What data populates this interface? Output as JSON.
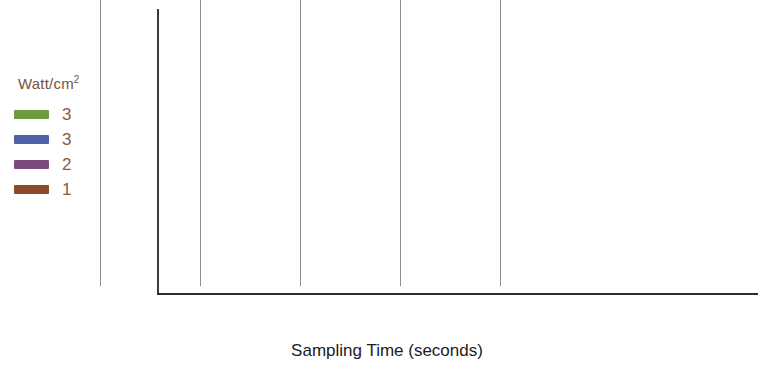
{
  "chart_data": {
    "type": "line",
    "title": "",
    "xlabel": "Sampling Time (seconds)",
    "ylabel": "",
    "legend_title": "Watt/cm",
    "legend_title_sup": "2",
    "legend_position": "left",
    "grid": "vertical",
    "x": [
      0,
      30,
      60,
      90,
      120,
      150,
      180
    ],
    "xlim": [
      0,
      180
    ],
    "ylim": [
      5,
      46
    ],
    "xticks": [
      "0",
      "30",
      "60",
      "90",
      "120",
      "150",
      "180"
    ],
    "yticks": [
      "10",
      "20",
      "30",
      "40"
    ],
    "ytick_values": [
      10,
      20,
      30,
      40
    ],
    "series": [
      {
        "name": "3",
        "color": "#6d9b3f",
        "values": [
          19.5,
          35.5,
          40.6,
          41.1,
          41.2,
          43.0,
          45.0
        ]
      },
      {
        "name": "3",
        "color": "#4f62a8",
        "values": [
          23.7,
          26.1,
          26.1,
          27.0,
          28.1,
          29.5,
          31.0
        ]
      },
      {
        "name": "2",
        "color": "#7c4a7e",
        "values": [
          19.2,
          24.2,
          24.5,
          25.1,
          25.5,
          25.4,
          25.3
        ]
      },
      {
        "name": "1",
        "color": "#8b4a2c",
        "values": [
          19.4,
          21.2,
          21.4,
          22.5,
          23.9,
          23.9,
          24.0
        ]
      }
    ]
  },
  "legend": {
    "title": "Watt/cm",
    "title_superscript": "2",
    "items": [
      {
        "label": "3",
        "color": "#6d9b3f"
      },
      {
        "label": "3",
        "color": "#4f62a8"
      },
      {
        "label": "2",
        "color": "#7c4a7e"
      },
      {
        "label": "1",
        "color": "#8b4a2c"
      }
    ]
  },
  "axes": {
    "x_title": "Sampling Time (seconds)",
    "x_labels": [
      "0",
      "30",
      "60",
      "90",
      "120",
      "150",
      "180"
    ],
    "y_labels": [
      "40",
      "30",
      "20",
      "10"
    ]
  }
}
